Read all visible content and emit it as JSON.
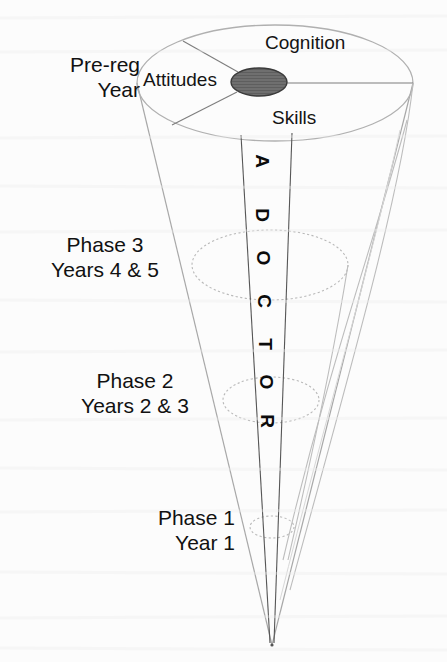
{
  "figure": {
    "type": "cone-diagram",
    "background_color": "#fcfcfc",
    "line_color": "#9a9a9a",
    "dark_line_color": "#4a4a4a",
    "text_color": "#111111",
    "hub_fill_color": "#6f6f6f"
  },
  "stage_labels": [
    {
      "id": "pre-reg",
      "line1": "Pre-reg",
      "line2": "Year"
    },
    {
      "id": "phase-3",
      "line1": "Phase 3",
      "line2": "Years 4 & 5"
    },
    {
      "id": "phase-2",
      "line1": "Phase 2",
      "line2": "Years 2 & 3"
    },
    {
      "id": "phase-1",
      "line1": "Phase 1",
      "line2": "Year 1"
    }
  ],
  "sectors": [
    {
      "id": "cognition",
      "label": "Cognition"
    },
    {
      "id": "attitudes",
      "label": "Attitudes"
    },
    {
      "id": "skills",
      "label": "Skills"
    }
  ],
  "axis_text": {
    "full": "A DOCTOR",
    "letters": [
      "A",
      "D",
      "O",
      "C",
      "T",
      "O",
      "R"
    ]
  }
}
